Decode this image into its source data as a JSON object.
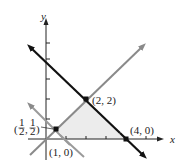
{
  "axes": {
    "x_label": "x",
    "y_label": "y"
  },
  "points": [
    {
      "label": "(2, 2)",
      "x": 2,
      "y": 2
    },
    {
      "label": "(4, 0)",
      "x": 4,
      "y": 0
    },
    {
      "label": "(1, 0)",
      "x": 1,
      "y": 0
    },
    {
      "label_num": "1",
      "label_den": "2",
      "x": 0.5,
      "y": 0.5
    }
  ],
  "lines": [
    {
      "name": "x + y = 4",
      "color": "#111111"
    },
    {
      "name": "y = x",
      "color": "#8a8a8a"
    },
    {
      "name": "x + y = 1",
      "color": "#9a9a9a"
    }
  ],
  "region_color": "#ececec"
}
